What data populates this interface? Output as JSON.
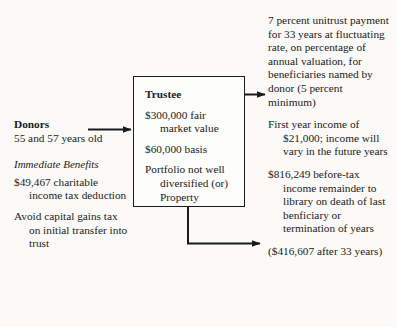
{
  "diagram": {
    "donors": {
      "heading": "Donors",
      "ages": "55 and 57 years old",
      "benefits_title": "Immediate Benefits",
      "benefit_items": [
        "$49,467 charitable income tax deduction",
        "Avoid capital gains tax on initial transfer into trust"
      ]
    },
    "trustee": {
      "title": "Trustee",
      "items": [
        "$300,000 fair market value",
        "$60,000 basis",
        "Portfolio not well diversified (or) Property"
      ]
    },
    "outcomes": [
      "7 percent unitrust payment for 33 years at fluctuating rate, on percentage of annual valuation, for beneficiaries named by donor (5 percent minimum)",
      "First year income of $21,000; income will vary in the future years",
      "$816,249 before-tax income remainder to library on death of last benficiary or termination of years",
      "($416,607 after 33 years)"
    ],
    "arrows": {
      "donors_to_trustee": "arrow-donors-to-trustee",
      "trustee_to_income": "arrow-trustee-to-unitrust",
      "trustee_to_remainder": "arrow-trustee-to-remainder"
    },
    "colors": {
      "ink": "#1b1b1b",
      "background": "#fbfaf8",
      "box_fill": "#fdfdfc"
    }
  }
}
